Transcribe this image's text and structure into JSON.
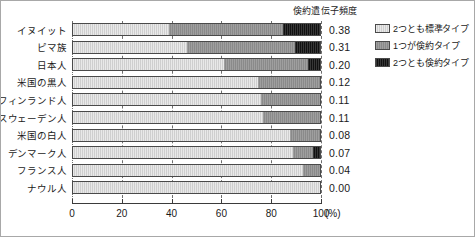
{
  "chart_data": {
    "type": "bar",
    "orientation": "horizontal",
    "stacked": true,
    "stack_mode": "percent",
    "title": "倹約遺伝子頻度",
    "xlabel": "(%)",
    "ylabel": "",
    "xlim": [
      0,
      100
    ],
    "xticks": [
      0,
      20,
      40,
      60,
      80,
      100
    ],
    "xtick_labels": [
      "0",
      "20",
      "40",
      "60",
      "80",
      "100"
    ],
    "x_unit_label": "(%)",
    "grid": "vertical-dashed",
    "legend_position": "right",
    "categories": [
      "イヌイット",
      "ピマ族",
      "日本人",
      "米国の黒人",
      "フィンランド人",
      "スウェーデン人",
      "米国の白人",
      "デンマーク人",
      "フランス人",
      "ナウル人"
    ],
    "series": [
      {
        "name": "2つとも標準タイプ",
        "color": "#cfcfcf",
        "values": [
          39,
          46,
          61,
          75,
          76,
          77,
          88,
          89,
          93,
          100
        ]
      },
      {
        "name": "1つが倹約タイプ",
        "color": "#8a8a8a",
        "values": [
          46,
          44,
          34,
          25,
          24,
          23,
          12,
          8,
          7,
          0
        ]
      },
      {
        "name": "2つとも倹約タイプ",
        "color": "#111111",
        "values": [
          15,
          10,
          5,
          0,
          0,
          0,
          0,
          3,
          0,
          0
        ]
      }
    ],
    "value_column_label": "倹約遺伝子頻度",
    "values": [
      "0.38",
      "0.31",
      "0.20",
      "0.12",
      "0.11",
      "0.11",
      "0.08",
      "0.07",
      "0.04",
      "0.00"
    ]
  },
  "legend": {
    "items": [
      {
        "label": "2つとも標準タイプ",
        "color": "#cfcfcf"
      },
      {
        "label": "1つが倹約タイプ",
        "color": "#8a8a8a"
      },
      {
        "label": "2つとも倹約タイプ",
        "color": "#111111"
      }
    ]
  },
  "colors": {
    "standard": "#cfcfcf",
    "heterozygous": "#8a8a8a",
    "homozygous": "#111111",
    "axis": "#3b3b3b",
    "grid": "#6f6f6f",
    "text": "#1a1a1a",
    "frame": "#a8a8a8",
    "background": "#ffffff"
  }
}
